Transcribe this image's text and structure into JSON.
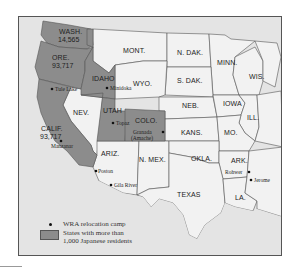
{
  "map": {
    "colors": {
      "frame_background": "#e4e4e4",
      "highlighted_state": "#8c8c8c",
      "other_state": "#f2f2f2",
      "border": "#555555"
    },
    "highlighted_states": [
      {
        "abbr": "WASH.",
        "population": "14,565"
      },
      {
        "abbr": "ORE.",
        "population": "4,071"
      },
      {
        "abbr": "CALIF.",
        "population": "93,717"
      },
      {
        "abbr": "IDAHO",
        "population": ""
      },
      {
        "abbr": "UTAH",
        "population": ""
      },
      {
        "abbr": "COLO.",
        "population": ""
      }
    ],
    "other_states": [
      "MONT.",
      "N. DAK.",
      "MINN.",
      "WIS.",
      "S. DAK.",
      "WYO.",
      "NEB.",
      "IOWA",
      "ILL.",
      "NEV.",
      "KANS.",
      "MO.",
      "ARIZ.",
      "N. MEX.",
      "OKLA.",
      "ARK.",
      "TEXAS",
      "LA."
    ],
    "camps": [
      {
        "name": "Tule Lake"
      },
      {
        "name": "Minidoka"
      },
      {
        "name": "Topaz"
      },
      {
        "name": "Granada"
      },
      {
        "name": "(Amache)"
      },
      {
        "name": "Manzanar"
      },
      {
        "name": "Poston"
      },
      {
        "name": "Gila River"
      },
      {
        "name": "Rohwer"
      },
      {
        "name": "Jerome"
      }
    ]
  },
  "legend": {
    "camp_label": "WRA relocation camp",
    "state_label_line1": "States with more than",
    "state_label_line2": "1,000 Japanese residents"
  }
}
